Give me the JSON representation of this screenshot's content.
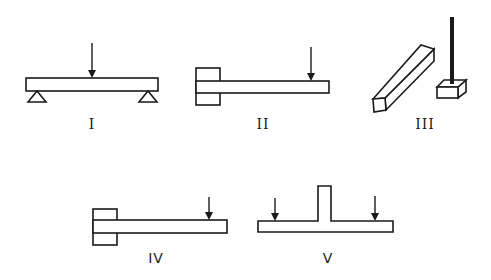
{
  "figure": {
    "items": [
      {
        "id": "I",
        "label": "I",
        "type": "simply-supported-beam",
        "loads": 1
      },
      {
        "id": "II",
        "label": "II",
        "type": "cantilever-beam",
        "loads": 1
      },
      {
        "id": "III",
        "label": "III",
        "type": "bar-and-rod",
        "loads": 0
      },
      {
        "id": "IV",
        "label": "IV",
        "type": "cantilever-beam",
        "loads": 1
      },
      {
        "id": "V",
        "label": "V",
        "type": "t-beam",
        "loads": 2
      }
    ]
  },
  "colors": {
    "stroke": "#1a1a1a",
    "background": "#ffffff"
  }
}
